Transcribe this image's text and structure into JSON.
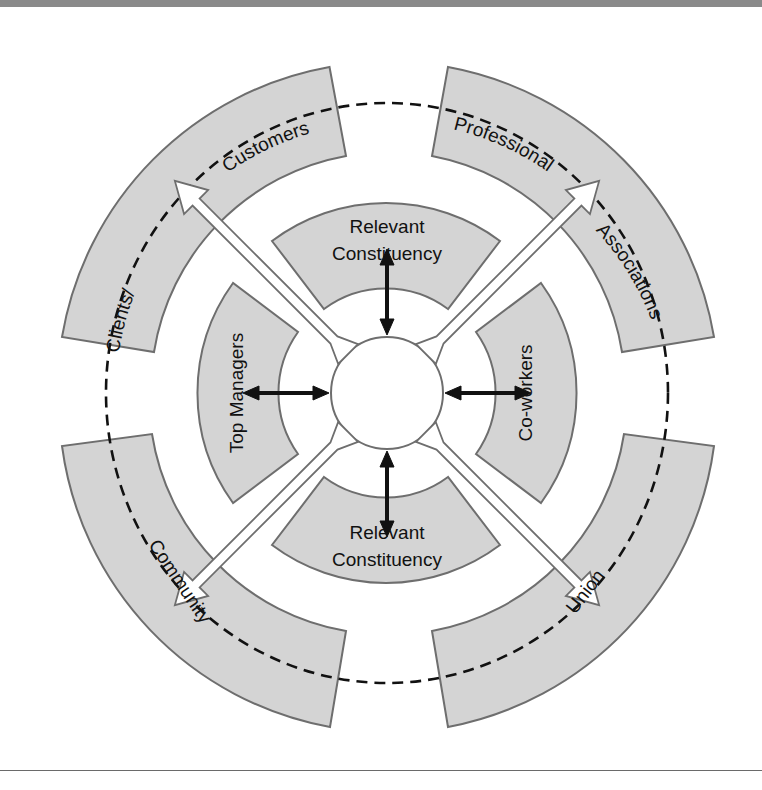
{
  "diagram": {
    "outer_ring": {
      "labels": {
        "top_left_a": "Clients/",
        "top_left_b": "Customers",
        "top_right_a": "Professional",
        "top_right_b": "Associations",
        "bottom_left": "Community",
        "bottom_right": "Union"
      }
    },
    "inner_ring": {
      "top_line1": "Relevant",
      "top_line2": "Constituency",
      "bottom_line1": "Relevant",
      "bottom_line2": "Constituency",
      "left": "Top Managers",
      "right": "Co-workers"
    },
    "colors": {
      "band_fill": "#d4d4d4",
      "band_stroke": "#6e6e6e",
      "text": "#111111",
      "rule": "#8a8a8a"
    }
  }
}
